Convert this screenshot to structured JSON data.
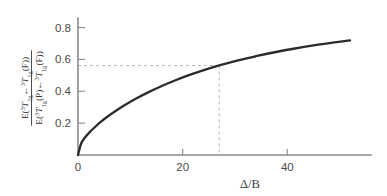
{
  "chart_data": {
    "type": "line",
    "title": "",
    "subtitle": "",
    "xlabel": "Δ/B",
    "ylabel": "E(3T2g ← 3T1g(F)) / E(3T1g(P) ← 3T1g(F))",
    "ylabel_parts": {
      "numerator": {
        "prefix": "E(",
        "sup1": "3",
        "term1": "T",
        "sub1": "2g",
        "arrow": "←",
        "sup2": "3",
        "term2": "T",
        "sub2": "1g",
        "suffix": "(F))"
      },
      "denominator": {
        "prefix": "E(",
        "sup1": "3",
        "term1": "T",
        "sub1": "1g",
        "mid": "(P)",
        "arrow": "←",
        "sup2": "3",
        "term2": "T",
        "sub2": "1g",
        "suffix": "(F))"
      }
    },
    "xlim": [
      0,
      56
    ],
    "ylim": [
      0,
      0.86
    ],
    "xticks": [
      0,
      20,
      40
    ],
    "xtick_labels": [
      "0",
      "20",
      "40"
    ],
    "yticks": [
      0.2,
      0.4,
      0.6,
      0.8
    ],
    "ytick_labels": [
      "0.2",
      "0.4",
      "0.6",
      "0.8"
    ],
    "grid": false,
    "legend": null,
    "series": [
      {
        "name": "energy-ratio",
        "color": "#2b2b2b",
        "x": [
          0,
          0.6,
          1.3,
          2.2,
          3.2,
          4.4,
          5.8,
          7.4,
          9.2,
          11.2,
          13.4,
          15.8,
          18.4,
          21.2,
          24.2,
          27.0,
          30.6,
          34.0,
          37.6,
          41.2,
          45.0,
          48.6,
          52.0
        ],
        "values": [
          0.0,
          0.072,
          0.108,
          0.142,
          0.174,
          0.209,
          0.245,
          0.281,
          0.318,
          0.356,
          0.393,
          0.43,
          0.466,
          0.501,
          0.534,
          0.562,
          0.594,
          0.62,
          0.645,
          0.667,
          0.688,
          0.705,
          0.72
        ]
      }
    ],
    "annotations": {
      "guide_lines": {
        "x_value": 27.0,
        "y_value": 0.562,
        "style": "dashed",
        "color": "#b9b9b9"
      }
    },
    "colors": {
      "curve": "#2b2b2b",
      "axis": "#8a8a8a",
      "guide": "#b9b9b9",
      "text": "#3a3a3a",
      "background": "#ffffff"
    }
  }
}
